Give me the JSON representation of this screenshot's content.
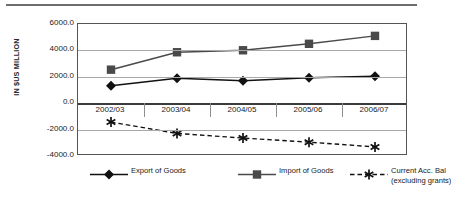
{
  "chart_data": {
    "type": "line",
    "title": "",
    "xlabel": "",
    "ylabel": "IN $US MILLION",
    "categories": [
      "2002/03",
      "2003/04",
      "2004/05",
      "2005/06",
      "2006/07"
    ],
    "ylim": [
      -4000,
      6000
    ],
    "ytick_labels": [
      "6000.0",
      "4000.0",
      "2000.0",
      "0.0",
      "-2000.0",
      "-4000.0"
    ],
    "ytick_values": [
      6000,
      4000,
      2000,
      0,
      -2000,
      -4000
    ],
    "grid": true,
    "legend_position": "bottom",
    "series": [
      {
        "name": "Export of Goods",
        "marker": "diamond",
        "linestyle": "solid",
        "color": "#111111",
        "values": [
          1330,
          1890,
          1700,
          1930,
          2050
        ]
      },
      {
        "name": "Import of Goods",
        "marker": "square",
        "linestyle": "solid",
        "color": "#4a4a4a",
        "values": [
          2540,
          3860,
          4010,
          4500,
          5100
        ]
      },
      {
        "name": "Current Acc. Bal (excluding grants)",
        "marker": "asterisk",
        "linestyle": "dashed",
        "color": "#111111",
        "values": [
          -1430,
          -2290,
          -2640,
          -2950,
          -3310
        ]
      }
    ]
  },
  "legend": {
    "items": [
      {
        "label": "Export of Goods",
        "label_line2": "",
        "icon": "diamond-marker-icon"
      },
      {
        "label": "Import of Goods",
        "label_line2": "",
        "icon": "square-marker-icon"
      },
      {
        "label": "Current Acc. Bal",
        "label_line2": "(excluding grants)",
        "icon": "asterisk-marker-icon"
      }
    ]
  },
  "colors": {
    "export": "#111111",
    "import": "#4a4a4a",
    "current_account": "#111111",
    "gridline": "#a8a8a8",
    "axis": "#545454"
  }
}
